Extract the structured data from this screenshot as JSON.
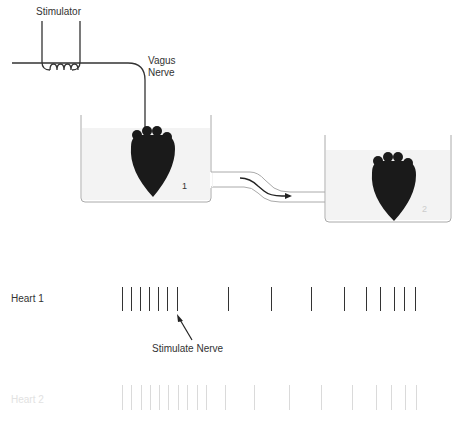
{
  "diagram": {
    "labels": {
      "stimulator": "Stimulator",
      "vagus_nerve_line1": "Vagus",
      "vagus_nerve_line2": "Nerve",
      "beaker1_number": "1",
      "beaker2_number": "2",
      "heart1_trace": "Heart 1",
      "heart2_trace": "Heart 2",
      "stimulate_nerve": "Stimulate Nerve"
    },
    "colors": {
      "line": "#333333",
      "heart": "#1a1a1a",
      "fluid": "#f3f3f3",
      "faint": "#dadada"
    }
  },
  "traces": {
    "heart1": {
      "label": "Heart 1",
      "beat_x": [
        122,
        131,
        140,
        149,
        158,
        167,
        177,
        228,
        271,
        311,
        344,
        366,
        380,
        394,
        404,
        415
      ],
      "stimulus_at_beat_index": 6
    },
    "heart2": {
      "label": "Heart 2",
      "beat_x": [
        122,
        131,
        141,
        150,
        159,
        168,
        178,
        187,
        197,
        206,
        225,
        254,
        289,
        321,
        352,
        376,
        391,
        405,
        416
      ]
    }
  }
}
